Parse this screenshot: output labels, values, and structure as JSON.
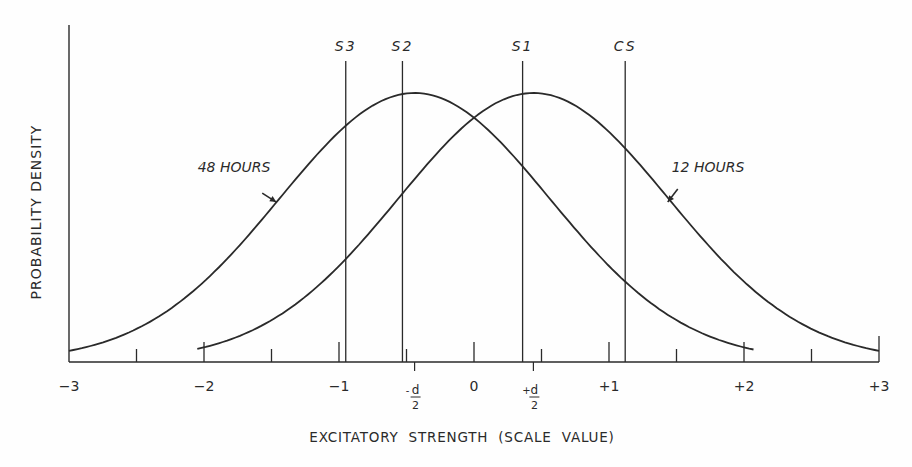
{
  "chart_data": {
    "type": "line",
    "title": "",
    "xlabel": "EXCITATORY STRENGTH (SCALE VALUE)",
    "ylabel": "PROBABILITY DENSITY",
    "xlim": [
      -3,
      3
    ],
    "x_ticks": [
      -3,
      -2,
      -1,
      0,
      1,
      2,
      3
    ],
    "x_tick_labels": [
      "−3",
      "−2",
      "−1",
      "0",
      "+1",
      "+2",
      "+3"
    ],
    "x_minor_ticks": [
      -2.5,
      -1.5,
      -0.5,
      0.5,
      1.5,
      2.5
    ],
    "special_ticks": [
      {
        "value": -0.44,
        "sign": "-",
        "num": "d",
        "den": "2"
      },
      {
        "value": 0.44,
        "sign": "+",
        "num": "d",
        "den": "2"
      }
    ],
    "grid": false,
    "series": [
      {
        "name": "48 HOURS",
        "distribution": "normal",
        "mean": -0.44,
        "sd": 1.0,
        "x_range": [
          -3.0,
          2.07
        ],
        "label_x": -1.7,
        "label_y": 172,
        "arrow_to_x": -1.45
      },
      {
        "name": "12 HOURS",
        "distribution": "normal",
        "mean": 0.44,
        "sd": 1.0,
        "x_range": [
          -2.05,
          3.0
        ],
        "label_x": 1.45,
        "label_y": 172,
        "arrow_to_x": 1.45
      }
    ],
    "stimulus_lines": [
      {
        "label": "S3",
        "x": -0.95
      },
      {
        "label": "S2",
        "x": -0.53
      },
      {
        "label": "S1",
        "x": 0.36
      },
      {
        "label": "CS",
        "x": 1.12
      }
    ]
  },
  "colors": {
    "ink": "#2a2a2a",
    "background": "#fefefe"
  }
}
